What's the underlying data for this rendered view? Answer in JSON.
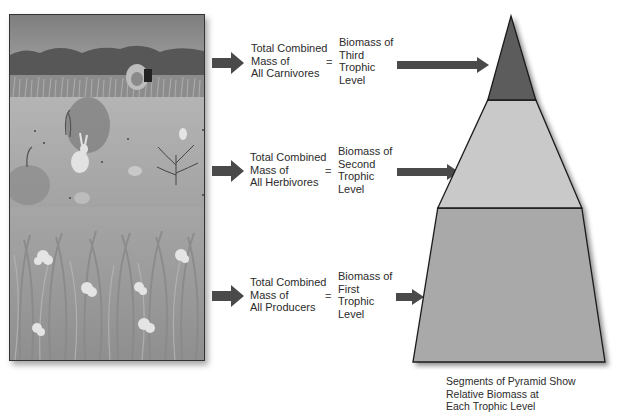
{
  "scene": {
    "description": "Grassland ecosystem illustration with carnivore (lion), herbivores (rabbits, squirrels, birds) and producers (grasses, flowers)",
    "colors": {
      "sky": "#8f8f8f",
      "mountains": "#585858",
      "field": "#a9a9a9",
      "grass": "#979797",
      "flowers": "#e4e4e4"
    }
  },
  "rows": [
    {
      "left_text": "Total Combined\nMass of\nAll Carnivores",
      "equals": "=",
      "right_text": "Biomass of\nThird\nTrophic\nLevel",
      "points_to": "top-segment"
    },
    {
      "left_text": "Total Combined\nMass of\nAll Herbivores",
      "equals": "=",
      "right_text": "Biomass of\nSecond\nTrophic\nLevel",
      "points_to": "middle-segment"
    },
    {
      "left_text": "Total Combined\nMass of\nAll Producers",
      "equals": "=",
      "right_text": "Biomass of\nFirst\nTrophic\nLevel",
      "points_to": "bottom-segment"
    }
  ],
  "pyramid": {
    "segments": [
      {
        "name": "Third Trophic Level",
        "color": "#5c5c5c"
      },
      {
        "name": "Second Trophic Level",
        "color": "#c9c9c9"
      },
      {
        "name": "First Trophic Level",
        "color": "#a9a9a9"
      }
    ],
    "caption": "Segments of Pyramid Show\nRelative Biomass at\nEach Trophic Level"
  },
  "colors": {
    "arrow": "#4a4a4a",
    "outline": "#1a1a1a"
  }
}
